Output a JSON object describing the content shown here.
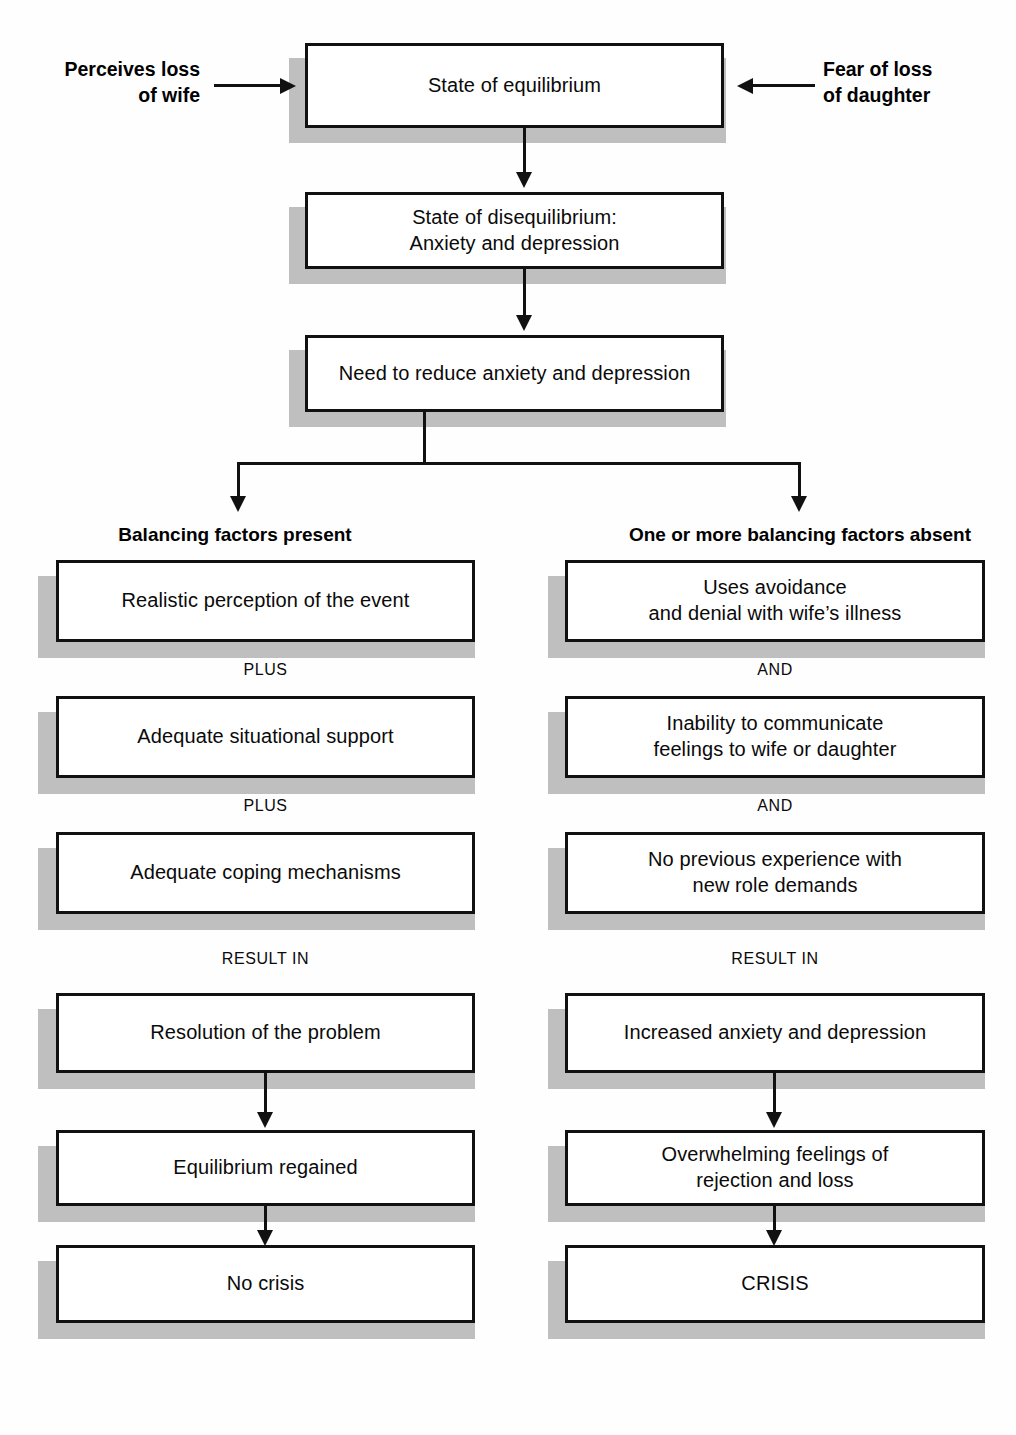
{
  "diagram": {
    "colors": {
      "box_border": "#111111",
      "box_fill": "#ffffff",
      "shadow": "#bfbfbf",
      "line": "#111111"
    }
  },
  "inputs": {
    "left": {
      "line1": "Perceives loss",
      "line2": "of wife"
    },
    "right": {
      "line1": "Fear of loss",
      "line2": "of daughter"
    }
  },
  "stem": {
    "equilibrium": "State of equilibrium",
    "disequilibrium_line1": "State of disequilibrium:",
    "disequilibrium_line2": "Anxiety and depression",
    "need": "Need to reduce anxiety and depression"
  },
  "columns": {
    "left": {
      "header": "Balancing factors present",
      "boxes": [
        {
          "line1": "Realistic perception of the event",
          "line2": ""
        },
        {
          "line1": "Adequate situational support",
          "line2": ""
        },
        {
          "line1": "Adequate coping mechanisms",
          "line2": ""
        },
        {
          "line1": "Resolution of the problem",
          "line2": ""
        },
        {
          "line1": "Equilibrium regained",
          "line2": ""
        },
        {
          "line1": "No crisis",
          "line2": ""
        }
      ],
      "connectors": [
        "PLUS",
        "PLUS",
        "RESULT IN"
      ]
    },
    "right": {
      "header": "One or more balancing factors absent",
      "boxes": [
        {
          "line1": "Uses avoidance",
          "line2": "and denial with wife’s illness"
        },
        {
          "line1": "Inability to communicate",
          "line2": "feelings to wife or daughter"
        },
        {
          "line1": "No previous experience with",
          "line2": "new role demands"
        },
        {
          "line1": "Increased anxiety and depression",
          "line2": ""
        },
        {
          "line1": "Overwhelming feelings of",
          "line2": "rejection and loss"
        },
        {
          "line1": "CRISIS",
          "line2": ""
        }
      ],
      "connectors": [
        "AND",
        "AND",
        "RESULT IN"
      ]
    }
  }
}
